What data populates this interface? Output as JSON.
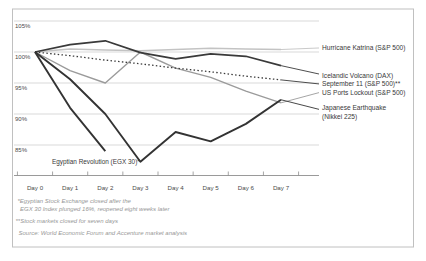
{
  "chart_data": {
    "type": "line",
    "title": "",
    "x_labels": [
      "Day 0",
      "Day 1",
      "Day 2",
      "Day 3",
      "Day 4",
      "Day 5",
      "Day 6",
      "Day 7"
    ],
    "y_axis": {
      "ticks": [
        "105%",
        "100%",
        "95%",
        "90%",
        "85%"
      ],
      "min": 85,
      "max": 105,
      "grid": true
    },
    "legend_position": "right-labels",
    "series": [
      {
        "id": "katrina",
        "label": "Hurricane Katrina (S&P 500)",
        "color": "#c3c3c3",
        "line_style": "solid",
        "values": [
          100,
          100.5,
          100.3,
          100.2,
          100.4,
          100.6,
          100.5,
          100.4
        ]
      },
      {
        "id": "usports",
        "label": "US Ports Lockout (S&P 500)",
        "color": "#9b9b9b",
        "line_style": "solid",
        "values": [
          100,
          97.0,
          95.0,
          100.0,
          97.4,
          95.9,
          93.7,
          91.8
        ]
      },
      {
        "id": "sept11",
        "label": "September 11 (S&P 500)**",
        "color": "#3a3a3a",
        "line_style": "dotted",
        "values": [
          100,
          99.4,
          98.7,
          98.1,
          97.4,
          96.8,
          96.1,
          95.5
        ]
      },
      {
        "id": "icelandic",
        "label": "Icelandic Volcano (DAX)",
        "color": "#3a3a3a",
        "line_style": "solid",
        "values": [
          100,
          101.2,
          101.8,
          99.9,
          98.9,
          99.7,
          99.3,
          97.8
        ]
      },
      {
        "id": "japanese",
        "label": "Japanese Earthquake (Nikkei 225)",
        "label_lines": [
          "Japanese Earthquake",
          "(Nikkei 225)"
        ],
        "color": "#333333",
        "line_style": "solid",
        "values": [
          100,
          95.6,
          90.0,
          82.3,
          87.1,
          85.6,
          88.4,
          92.3
        ]
      },
      {
        "id": "egypt",
        "label": "Egyptian Revolution (EGX 30)*",
        "color": "#333333",
        "line_style": "solid",
        "values": [
          100,
          91.0,
          84.0,
          null,
          null,
          null,
          null,
          null
        ]
      }
    ]
  },
  "footnotes": {
    "egypt_line1": "*Egyptian Stock Exchange closed after the",
    "egypt_line2": "EGX 30 Index plunged 16%, reopened eight weeks later",
    "markets_closed": "**Stock markets closed for seven days",
    "source": "Source: World Economic Forum and Accenture market analysis"
  },
  "colors": {
    "border": "#c0c0c0",
    "gridline": "#c9c9c9",
    "axis": "#8f8f8f",
    "light_series": "#c3c3c3",
    "gray_series": "#9b9b9b",
    "dark_series": "#333333"
  }
}
